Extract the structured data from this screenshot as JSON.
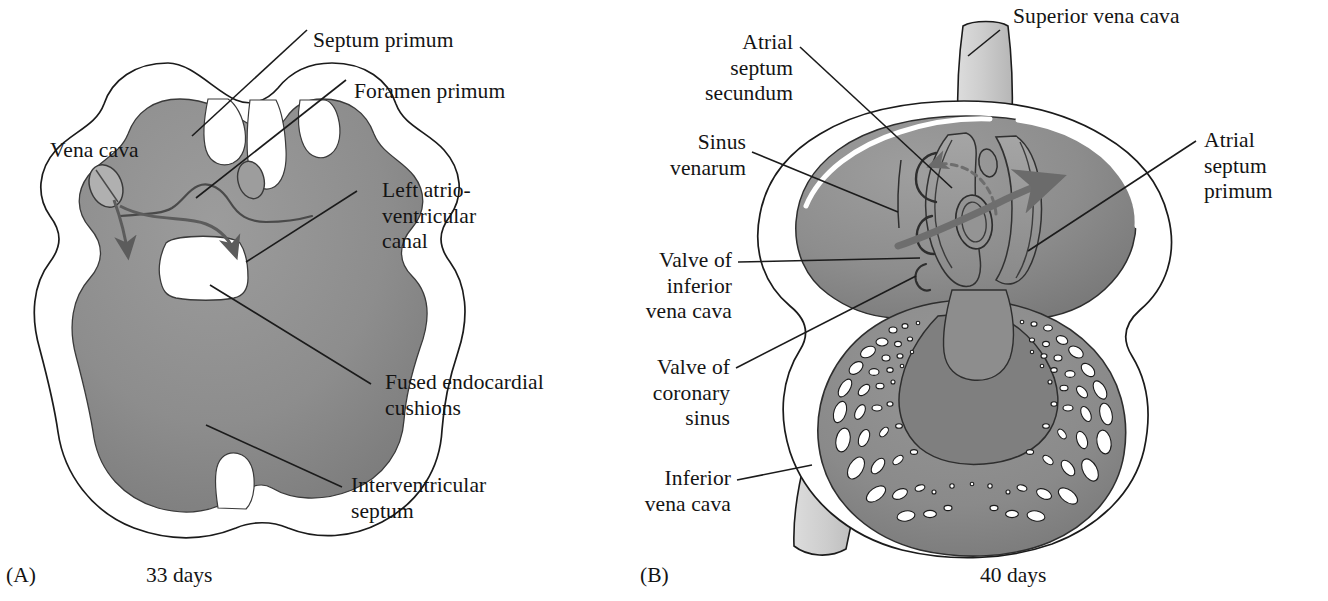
{
  "figure": {
    "kind": "anatomical-diagram",
    "background_color": "#ffffff",
    "ink_color": "#141414"
  },
  "colors": {
    "myocardium_gray": "#8f8f8f",
    "myocardium_gray_dark": "#7d7d7d",
    "lumen_white": "#ffffff",
    "vessel_light_gray": "#d2d2d2",
    "vessel_light_gray_2": "#c4c4c4",
    "outline": "#1b1b1b",
    "arrow_gray": "#6e6e6e"
  },
  "panels": [
    {
      "tag": "(A)",
      "caption": "33 days",
      "labels": [
        {
          "id": "vena-cava",
          "text": "Vena cava"
        },
        {
          "id": "septum-primum",
          "text": "Septum primum"
        },
        {
          "id": "foramen-primum",
          "text": "Foramen primum"
        },
        {
          "id": "left-atrioventricular-canal",
          "text": "Left atrio-\nventricular\ncanal"
        },
        {
          "id": "fused-endocardial-cushions",
          "text": "Fused endocardial\ncushions"
        },
        {
          "id": "interventricular-septum",
          "text": "Interventricular\nseptum"
        }
      ]
    },
    {
      "tag": "(B)",
      "caption": "40 days",
      "labels": [
        {
          "id": "atrial-septum-secundum",
          "text": "Atrial\nseptum\nsecundum"
        },
        {
          "id": "sinus-venarum",
          "text": "Sinus\nvenarum"
        },
        {
          "id": "valve-of-inferior-vena-cava",
          "text": "Valve of\ninferior\nvena cava"
        },
        {
          "id": "valve-of-coronary-sinus",
          "text": "Valve of\ncoronary\nsinus"
        },
        {
          "id": "inferior-vena-cava",
          "text": "Inferior\nvena cava"
        },
        {
          "id": "superior-vena-cava",
          "text": "Superior vena cava"
        },
        {
          "id": "atrial-septum-primum",
          "text": "Atrial\nseptum\nprimum"
        }
      ]
    }
  ]
}
